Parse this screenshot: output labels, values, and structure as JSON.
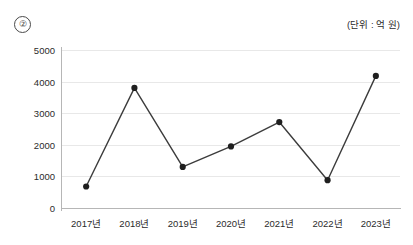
{
  "figure": {
    "marker": "②",
    "unit_label": "(단위 : 억 원)"
  },
  "chart_data": {
    "type": "line",
    "title": "",
    "subtitle": "",
    "xlabel": "",
    "ylabel": "",
    "unit_note": "(단위 : 억 원)",
    "categories": [
      "2017년",
      "2018년",
      "2019년",
      "2020년",
      "2021년",
      "2022년",
      "2023년"
    ],
    "values": [
      680,
      3800,
      1300,
      1950,
      2720,
      880,
      4180
    ],
    "series": [
      {
        "name": "금액",
        "values": [
          680,
          3800,
          1300,
          1950,
          2720,
          880,
          4180
        ]
      }
    ],
    "ylim": [
      0,
      5000
    ],
    "yticks": [
      0,
      1000,
      2000,
      3000,
      4000,
      5000
    ],
    "ytick_labels": [
      "0",
      "1000",
      "2000",
      "3000",
      "4000",
      "5000"
    ],
    "grid": true,
    "grid_axis": "y",
    "legend": false,
    "legend_position": "none",
    "marker_style": "circle",
    "line_color": "#3c3c3c",
    "marker_color": "#1f1f1f",
    "grid_color": "#e8e8e8",
    "axis_color": "#b6b6b6",
    "background_color": "#ffffff"
  }
}
